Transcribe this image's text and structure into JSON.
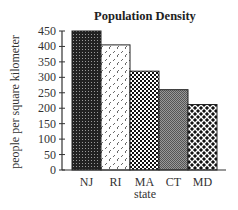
{
  "chart_data": {
    "type": "bar",
    "title": "Population Density",
    "xlabel": "state",
    "ylabel": "people per square kilometer",
    "categories": [
      "NJ",
      "RI",
      "MA",
      "CT",
      "MD"
    ],
    "values": [
      450,
      405,
      320,
      260,
      212
    ],
    "ylim": [
      0,
      450
    ],
    "yticks": [
      0,
      50,
      100,
      150,
      200,
      250,
      300,
      350,
      400,
      450
    ],
    "grid": false,
    "legend": null,
    "patterns": [
      "dense-dots-dark",
      "diagonal-dashes",
      "checker-dots",
      "fine-gray-check",
      "woven-lattice"
    ]
  }
}
